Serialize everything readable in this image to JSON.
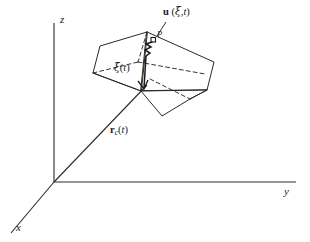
{
  "figure": {
    "background": "#ffffff",
    "stroke_color": "#2a2a2a",
    "text_color": "#1a1a1a",
    "width": 310,
    "height": 242
  },
  "axes": {
    "origin": {
      "x": 54,
      "y": 182
    },
    "labels": {
      "z": "z",
      "y": "y",
      "x": "x"
    },
    "z_label_pos": {
      "x": 60,
      "y": 20
    },
    "y_label_pos": {
      "x": 285,
      "y": 190
    },
    "x_label_pos": {
      "x": 17,
      "y": 226
    },
    "z_tip": {
      "x": 54,
      "y": 23
    },
    "y_tip": {
      "x": 296,
      "y": 182
    },
    "x_tip": {
      "x": 10,
      "y": 234
    }
  },
  "vectors": {
    "position": {
      "label_html": "<b>r</b><sub>c</sub>(<i>t</i>)",
      "label_plain": "r_c(t)",
      "label_pos": {
        "x": 112,
        "y": 130
      },
      "from": {
        "x": 54,
        "y": 182
      },
      "to": {
        "x": 146,
        "y": 86
      }
    },
    "local": {
      "label_html": "<span class=\"greek\">ξ</span>(<i>t</i>)",
      "label_plain": "ξ(t)",
      "label_pos": {
        "x": 117,
        "y": 68
      },
      "from": {
        "x": 146,
        "y": 86
      },
      "to": {
        "x": 145,
        "y": 55
      }
    },
    "displacement": {
      "label_html": "<b>u</b> (<span class=\"greek\">ξ</span>,<i>t</i>)",
      "label_plain": "u (ξ,t)",
      "label_pos": {
        "x": 163,
        "y": 10
      },
      "wavy_from": {
        "x": 145,
        "y": 55
      },
      "wavy_to": {
        "x": 151,
        "y": 43
      }
    },
    "point": {
      "label_plain": "P",
      "label_pos": {
        "x": 154,
        "y": 38
      }
    }
  },
  "body": {
    "name": "parallelepiped",
    "vertices": {
      "top_back": {
        "x": 147,
        "y": 32
      },
      "top_left": {
        "x": 100,
        "y": 46
      },
      "top_right": {
        "x": 214,
        "y": 62
      },
      "mid_left": {
        "x": 93,
        "y": 73
      },
      "mid_right": {
        "x": 207,
        "y": 90
      },
      "front_apex": {
        "x": 141,
        "y": 91
      },
      "bot_apex": {
        "x": 162,
        "y": 116
      },
      "bot_right": {
        "x": 190,
        "y": 99
      },
      "hidden_ctr": {
        "x": 138,
        "y": 62
      }
    },
    "solid_edges": [
      [
        "top_back",
        "top_left"
      ],
      [
        "top_back",
        "top_right"
      ],
      [
        "top_left",
        "mid_left"
      ],
      [
        "top_right",
        "mid_right"
      ],
      [
        "mid_left",
        "front_apex"
      ],
      [
        "front_apex",
        "bot_apex"
      ],
      [
        "bot_apex",
        "bot_right"
      ],
      [
        "bot_right",
        "mid_right"
      ],
      [
        "mid_right",
        "bot_apex"
      ],
      [
        "front_apex",
        "mid_right"
      ]
    ],
    "dashed_edges": [
      [
        "top_back",
        "hidden_ctr"
      ],
      [
        "mid_left",
        "hidden_ctr"
      ],
      [
        "hidden_ctr",
        "bot_right"
      ],
      [
        "top_right",
        "hidden_ctr"
      ]
    ]
  }
}
